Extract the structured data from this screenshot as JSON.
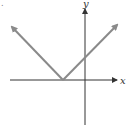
{
  "figure": {
    "marker": ".",
    "x_axis_label": "x",
    "y_axis_label": "y"
  },
  "colors": {
    "axis": "#333333",
    "curve": "#8a8a8a",
    "background": "#ffffff"
  }
}
